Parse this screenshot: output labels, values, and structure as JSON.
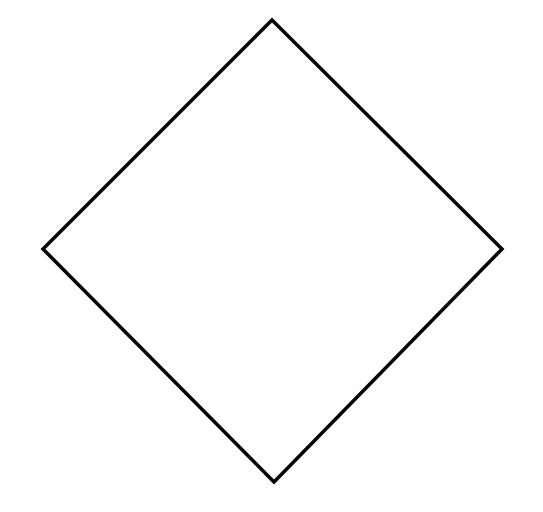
{
  "diagram": {
    "shape": "diamond",
    "stroke_color": "#000000",
    "fill_color": "#ffffff",
    "stroke_width": 3.5,
    "vertices": {
      "top": [
        272,
        20
      ],
      "right": [
        502,
        249
      ],
      "bottom": [
        274,
        482
      ],
      "left": [
        43,
        249
      ]
    },
    "points": "272,20 502,249 274,482 43,249"
  }
}
